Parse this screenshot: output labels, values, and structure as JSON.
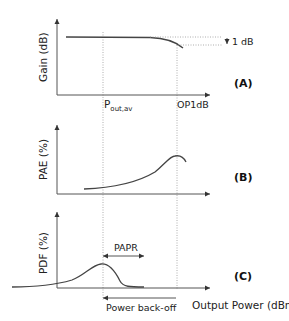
{
  "diagram": {
    "panels": [
      {
        "id": "A",
        "label": "(A)",
        "y_axis_label": "Gain (dB)",
        "curve": "gain"
      },
      {
        "id": "B",
        "label": "(B)",
        "y_axis_label": "PAE (%)",
        "curve": "pae"
      },
      {
        "id": "C",
        "label": "(C)",
        "y_axis_label": "PDF (%)",
        "curve": "pdf"
      }
    ],
    "markers": {
      "pout_av_main": "P",
      "pout_av_sub": "out,av",
      "op1db": "OP1dB",
      "one_db": "1 dB"
    },
    "annotations": {
      "papr": "PAPR",
      "power_backoff": "Power back-off"
    },
    "x_axis_label": "Output Power (dBm)",
    "colors": {
      "axis": "#555555",
      "curve": "#444444",
      "guide": "#999999",
      "text": "#222222"
    }
  }
}
